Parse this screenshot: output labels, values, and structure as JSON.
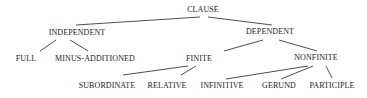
{
  "diagram": {
    "type": "tree",
    "root": "CLAUSE",
    "nodes": {
      "clause": "CLAUSE",
      "independent": "INDEPENDENT",
      "dependent": "DEPENDENT",
      "full": "FULL",
      "minus_additioned": "MINUS-ADDITIONED",
      "finite": "FINITE",
      "nonfinite": "NONFINITE",
      "subordinate": "SUBORDINATE",
      "relative": "RELATIVE",
      "infinitive": "INFINITIVE",
      "gerund": "GERUND",
      "participle": "PARTICIPLE"
    },
    "edges": [
      [
        "CLAUSE",
        "INDEPENDENT"
      ],
      [
        "CLAUSE",
        "DEPENDENT"
      ],
      [
        "INDEPENDENT",
        "FULL"
      ],
      [
        "INDEPENDENT",
        "MINUS-ADDITIONED"
      ],
      [
        "DEPENDENT",
        "FINITE"
      ],
      [
        "DEPENDENT",
        "NONFINITE"
      ],
      [
        "FINITE",
        "SUBORDINATE"
      ],
      [
        "FINITE",
        "RELATIVE"
      ],
      [
        "NONFINITE",
        "INFINITIVE"
      ],
      [
        "NONFINITE",
        "GERUND"
      ],
      [
        "NONFINITE",
        "PARTICIPLE"
      ]
    ]
  }
}
